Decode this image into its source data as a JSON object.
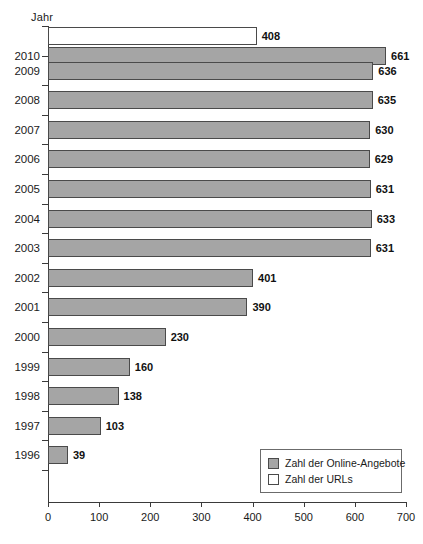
{
  "chart_data": {
    "type": "bar",
    "orientation": "horizontal",
    "title": "",
    "xlabel": "",
    "ylabel": "Jahr",
    "xlim": [
      0,
      700
    ],
    "xticks": [
      0,
      100,
      200,
      300,
      400,
      500,
      600,
      700
    ],
    "grid": false,
    "legend_position": "bottom-right",
    "categories": [
      "2010",
      "2009",
      "2008",
      "2007",
      "2006",
      "2005",
      "2004",
      "2003",
      "2002",
      "2001",
      "2000",
      "1999",
      "1998",
      "1997",
      "1996"
    ],
    "series": [
      {
        "name": "Zahl der URLs",
        "color": "#ffffff",
        "values": [
          408,
          null,
          null,
          null,
          null,
          null,
          null,
          null,
          null,
          null,
          null,
          null,
          null,
          null,
          null
        ]
      },
      {
        "name": "Zahl der Online-Angebote",
        "color": "#a5a5a5",
        "values": [
          661,
          636,
          635,
          630,
          629,
          631,
          633,
          631,
          401,
          390,
          230,
          160,
          138,
          103,
          39
        ]
      }
    ]
  },
  "axis": {
    "y_title": "Jahr",
    "tick_labels": [
      "0",
      "100",
      "200",
      "300",
      "400",
      "500",
      "600",
      "700"
    ]
  },
  "years": [
    {
      "label": "2010"
    },
    {
      "label": "2009"
    },
    {
      "label": "2008"
    },
    {
      "label": "2007"
    },
    {
      "label": "2006"
    },
    {
      "label": "2005"
    },
    {
      "label": "2004"
    },
    {
      "label": "2003"
    },
    {
      "label": "2002"
    },
    {
      "label": "2001"
    },
    {
      "label": "2000"
    },
    {
      "label": "1999"
    },
    {
      "label": "1998"
    },
    {
      "label": "1997"
    },
    {
      "label": "1996"
    }
  ],
  "legend": {
    "items": [
      {
        "label": "Zahl der Online-Angebote",
        "swatch": "online"
      },
      {
        "label": "Zahl der URLs",
        "swatch": "urls"
      }
    ]
  }
}
